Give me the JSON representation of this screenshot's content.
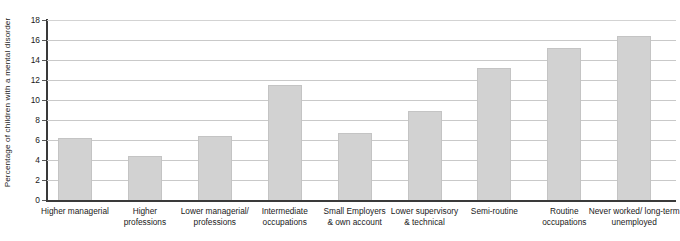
{
  "chart_data": {
    "type": "bar",
    "title": "",
    "xlabel": "",
    "ylabel": "Percentage of children with a mental disorder",
    "ylim": [
      0,
      18
    ],
    "yticks": [
      0,
      2,
      4,
      6,
      8,
      10,
      12,
      14,
      16,
      18
    ],
    "ytick_labels": [
      "0",
      "2",
      "4",
      "6",
      "8",
      "10",
      "12",
      "14",
      "16",
      "18"
    ],
    "grid": true,
    "legend": null,
    "bar_color": "#d2d2d2",
    "bar_border_color": "#c4c4c4",
    "axis_color": "#3a3a3a",
    "gridline_color": "#c9c9c9",
    "categories": [
      "Higher managerial",
      "Higher\nprofessions",
      "Lower managerial/\nprofessions",
      "Intermediate\noccupations",
      "Small Employers\n& own account",
      "Lower supervisory\n& technical",
      "Semi-routine",
      "Routine\noccupations",
      "Never worked/ long-term\nunemployed"
    ],
    "values": [
      6.2,
      4.4,
      6.4,
      11.5,
      6.7,
      8.9,
      13.2,
      15.2,
      16.4
    ]
  }
}
